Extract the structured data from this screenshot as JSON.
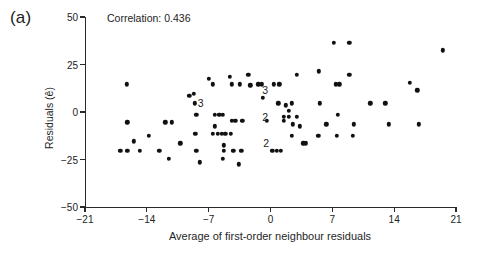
{
  "figure": {
    "panel_label": "(a)",
    "annotation": "Correlation: 0.436"
  },
  "chart_data": {
    "type": "scatter",
    "title": "",
    "annotations": [
      {
        "text": "Correlation: 0.436",
        "x": -16.5,
        "y": 46
      },
      {
        "text": "3",
        "x": -7.9,
        "y": 4.5
      },
      {
        "text": "3",
        "x": -0.6,
        "y": 11.5
      },
      {
        "text": "2",
        "x": -0.6,
        "y": -2.5
      },
      {
        "text": "2",
        "x": -0.5,
        "y": -16.5
      }
    ],
    "xlabel": "Average of first-order neighbour residuals",
    "ylabel": "Residuals (ê)",
    "xlim": [
      -21,
      21
    ],
    "ylim": [
      -50,
      50
    ],
    "xticks": [
      -21,
      -14,
      -7,
      0,
      7,
      14,
      21
    ],
    "yticks": [
      -50,
      -25,
      0,
      25,
      50
    ],
    "xtick_labels": [
      "−21",
      "−14",
      "−7",
      "0",
      "7",
      "14",
      "21"
    ],
    "ytick_labels": [
      "−50",
      "−25",
      "0",
      "25",
      "50"
    ],
    "grid": false,
    "legend": null,
    "marker": "filled-circle",
    "marker_color": "#111111",
    "correlation": 0.436,
    "points": [
      [
        -16.3,
        14.5
      ],
      [
        -16.2,
        -5.5
      ],
      [
        -15.5,
        -15.5
      ],
      [
        -17.0,
        -20.5
      ],
      [
        -16.2,
        -20.5
      ],
      [
        -14.8,
        -20.5
      ],
      [
        -13.8,
        -12.5
      ],
      [
        -12.6,
        -20.5
      ],
      [
        -11.9,
        -5.5
      ],
      [
        -11.2,
        -5.5
      ],
      [
        -11.5,
        -24.5
      ],
      [
        -10.2,
        -16.5
      ],
      [
        -9.2,
        8.5
      ],
      [
        -8.7,
        9.5
      ],
      [
        -8.6,
        4.5
      ],
      [
        -8.4,
        -1.5
      ],
      [
        -8.5,
        -11.5
      ],
      [
        -8.4,
        -20.5
      ],
      [
        -8.0,
        -26.5
      ],
      [
        -7.0,
        17.5
      ],
      [
        -6.5,
        14.5
      ],
      [
        -6.3,
        -1.5
      ],
      [
        -5.8,
        -1.5
      ],
      [
        -5.4,
        -1.5
      ],
      [
        -6.3,
        -7.5
      ],
      [
        -6.5,
        -11.5
      ],
      [
        -6.0,
        -11.5
      ],
      [
        -5.5,
        -11.5
      ],
      [
        -5.1,
        -11.5
      ],
      [
        -5.3,
        -17.5
      ],
      [
        -5.3,
        -20.5
      ],
      [
        -5.4,
        -24.5
      ],
      [
        -4.6,
        18.5
      ],
      [
        -4.4,
        14.5
      ],
      [
        -4.4,
        -4.5
      ],
      [
        -4.0,
        -4.5
      ],
      [
        -4.5,
        -11.5
      ],
      [
        -4.2,
        -20.5
      ],
      [
        -3.6,
        -27.5
      ],
      [
        -3.5,
        14.5
      ],
      [
        -3.2,
        -4.5
      ],
      [
        -3.3,
        -20.5
      ],
      [
        -2.5,
        19.5
      ],
      [
        -2.3,
        14.0
      ],
      [
        -1.4,
        14.5
      ],
      [
        -1.0,
        14.5
      ],
      [
        -0.9,
        7.5
      ],
      [
        -0.4,
        -4.5
      ],
      [
        0.2,
        -20.5
      ],
      [
        0.7,
        -20.5
      ],
      [
        1.2,
        -20.5
      ],
      [
        0.4,
        14.5
      ],
      [
        1.0,
        14.5
      ],
      [
        0.9,
        4.5
      ],
      [
        1.5,
        -4.5
      ],
      [
        1.7,
        3.5
      ],
      [
        1.5,
        -2.5
      ],
      [
        2.1,
        -2.5
      ],
      [
        2.4,
        4.5
      ],
      [
        2.5,
        -6.5
      ],
      [
        2.4,
        -12.5
      ],
      [
        2.1,
        0.5
      ],
      [
        3.0,
        -2.5
      ],
      [
        3.3,
        -7.5
      ],
      [
        3.7,
        -16.5
      ],
      [
        4.0,
        -16.5
      ],
      [
        3.0,
        19.5
      ],
      [
        5.5,
        21.5
      ],
      [
        5.6,
        4.5
      ],
      [
        5.4,
        -12.5
      ],
      [
        6.3,
        -6.5
      ],
      [
        7.2,
        36.5
      ],
      [
        7.4,
        14.5
      ],
      [
        7.8,
        14.5
      ],
      [
        7.6,
        -1.5
      ],
      [
        7.5,
        -12.5
      ],
      [
        8.9,
        36.5
      ],
      [
        8.9,
        19.5
      ],
      [
        9.4,
        -6.5
      ],
      [
        9.3,
        -12.5
      ],
      [
        11.3,
        4.5
      ],
      [
        13.0,
        4.5
      ],
      [
        13.4,
        -6.5
      ],
      [
        15.8,
        15.5
      ],
      [
        16.6,
        11.5
      ],
      [
        16.8,
        -6.5
      ],
      [
        19.5,
        32.5
      ]
    ],
    "overlap_counts": [
      {
        "label": "3",
        "x": -7.9,
        "y": 4.5
      },
      {
        "label": "3",
        "x": -0.6,
        "y": 11.5
      },
      {
        "label": "2",
        "x": -0.6,
        "y": -2.5
      },
      {
        "label": "2",
        "x": -0.5,
        "y": -16.5
      }
    ]
  }
}
